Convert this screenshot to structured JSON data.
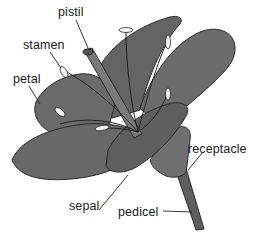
{
  "diagram": {
    "labels": [
      {
        "id": "pistil",
        "text": "pistil",
        "x": 58,
        "y": 6
      },
      {
        "id": "stamen",
        "text": "stamen",
        "x": 23,
        "y": 39
      },
      {
        "id": "petal",
        "text": "petal",
        "x": 13,
        "y": 73
      },
      {
        "id": "receptacle",
        "text": "receptacle",
        "x": 188,
        "y": 143
      },
      {
        "id": "sepal",
        "text": "sepal",
        "x": 69,
        "y": 200
      },
      {
        "id": "pedicel",
        "text": "pedicel",
        "x": 118,
        "y": 206
      }
    ],
    "colors": {
      "petal_fill": "#6b6b6b",
      "petal_dark": "#4a4a4a",
      "outline": "#2a2a2a",
      "anther": "#f2f2f2",
      "background": "#ffffff"
    }
  }
}
